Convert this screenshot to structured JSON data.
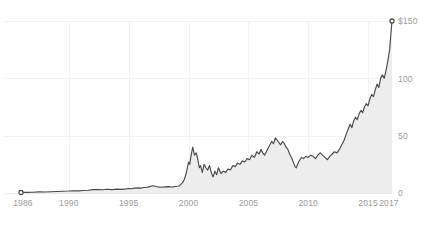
{
  "chart_data": {
    "type": "area",
    "title": "",
    "subtitle": "",
    "xlabel": "",
    "ylabel": "",
    "xlim": [
      1986,
      2017
    ],
    "ylim": [
      0,
      150
    ],
    "grid": true,
    "legend": null,
    "y_ticks": [
      0,
      50,
      100,
      150
    ],
    "y_tick_labels": [
      "0",
      "50",
      "100",
      "$150"
    ],
    "y_axis_position": "right",
    "x_ticks": [
      1986,
      1990,
      1995,
      2000,
      2005,
      2010,
      2015,
      2017
    ],
    "x_tick_labels": [
      "1986",
      "1990",
      "1995",
      "2000",
      "2005",
      "2010",
      "2015",
      "2017"
    ],
    "x_gridlines": [
      1990,
      1995,
      2000,
      2005,
      2010,
      2015
    ],
    "colors": {
      "line": "#4a4a4a",
      "area_fill": "#ededed",
      "gridline": "#f2f2f2",
      "baseline": "#e8e8e8",
      "tick_label": "#9a9a9a",
      "background": "#ffffff",
      "marker_stroke": "#3d3d3d",
      "marker_fill": "#ffffff"
    },
    "markers": [
      {
        "name": "start-marker",
        "x": 1986.0,
        "y": 0.5
      },
      {
        "name": "end-marker",
        "x": 2017.0,
        "y": 150.0
      }
    ],
    "series": [
      {
        "name": "price",
        "x": [
          1986.0,
          1986.5,
          1987.0,
          1987.5,
          1988.0,
          1988.5,
          1989.0,
          1989.5,
          1990.0,
          1990.4,
          1990.8,
          1991.2,
          1991.6,
          1992.0,
          1992.4,
          1992.8,
          1993.2,
          1993.6,
          1994.0,
          1994.4,
          1994.8,
          1995.0,
          1995.2,
          1995.5,
          1995.8,
          1996.0,
          1996.3,
          1996.6,
          1997.0,
          1997.4,
          1997.8,
          1998.0,
          1998.3,
          1998.6,
          1998.8,
          1999.0,
          1999.2,
          1999.35,
          1999.5,
          1999.65,
          1999.8,
          1999.9,
          2000.0,
          2000.1,
          2000.2,
          2000.35,
          2000.5,
          2000.65,
          2000.8,
          2000.9,
          2001.0,
          2001.15,
          2001.3,
          2001.45,
          2001.6,
          2001.75,
          2001.9,
          2002.05,
          2002.2,
          2002.35,
          2002.5,
          2002.7,
          2002.9,
          2003.1,
          2003.3,
          2003.5,
          2003.7,
          2003.9,
          2004.1,
          2004.3,
          2004.5,
          2004.7,
          2004.9,
          2005.1,
          2005.3,
          2005.5,
          2005.7,
          2005.9,
          2006.05,
          2006.2,
          2006.35,
          2006.5,
          2006.65,
          2006.8,
          2006.95,
          2007.1,
          2007.25,
          2007.4,
          2007.55,
          2007.7,
          2007.85,
          2008.0,
          2008.15,
          2008.3,
          2008.45,
          2008.6,
          2008.75,
          2008.9,
          2009.0,
          2009.15,
          2009.3,
          2009.45,
          2009.6,
          2009.8,
          2010.0,
          2010.2,
          2010.4,
          2010.6,
          2010.8,
          2011.0,
          2011.2,
          2011.4,
          2011.6,
          2011.8,
          2012.0,
          2012.2,
          2012.4,
          2012.6,
          2012.8,
          2013.0,
          2013.2,
          2013.35,
          2013.5,
          2013.65,
          2013.8,
          2013.95,
          2014.1,
          2014.25,
          2014.4,
          2014.55,
          2014.7,
          2014.85,
          2015.0,
          2015.15,
          2015.3,
          2015.45,
          2015.6,
          2015.75,
          2015.9,
          2016.05,
          2016.2,
          2016.35,
          2016.5,
          2016.65,
          2016.8,
          2016.9,
          2017.0
        ],
        "y": [
          0.5,
          0.6,
          0.7,
          1.0,
          0.9,
          1.1,
          1.3,
          1.5,
          1.7,
          2.0,
          1.8,
          2.2,
          2.4,
          2.9,
          3.1,
          2.8,
          3.3,
          3.0,
          3.4,
          3.2,
          3.6,
          3.9,
          3.7,
          4.2,
          4.5,
          4.3,
          4.8,
          5.1,
          6.3,
          5.4,
          5.0,
          5.3,
          5.6,
          5.2,
          5.5,
          5.9,
          6.1,
          7.5,
          9.0,
          12.0,
          17.0,
          22.0,
          27.0,
          25.0,
          32.0,
          40.0,
          33.0,
          35.0,
          28.0,
          22.0,
          24.0,
          18.0,
          25.0,
          22.0,
          20.0,
          24.0,
          18.0,
          14.0,
          19.0,
          16.0,
          22.0,
          17.0,
          19.0,
          18.0,
          21.0,
          20.0,
          24.0,
          23.0,
          26.0,
          25.0,
          28.0,
          27.0,
          30.0,
          29.0,
          33.0,
          31.0,
          36.0,
          34.0,
          38.0,
          35.0,
          33.0,
          36.0,
          39.0,
          42.0,
          45.0,
          43.0,
          48.0,
          46.0,
          44.0,
          42.0,
          45.0,
          43.0,
          40.0,
          38.0,
          34.0,
          31.0,
          27.0,
          23.0,
          22.0,
          26.0,
          29.0,
          31.0,
          30.0,
          32.0,
          31.0,
          33.0,
          32.0,
          30.0,
          33.0,
          35.0,
          33.0,
          31.0,
          29.0,
          32.0,
          34.0,
          36.0,
          35.0,
          38.0,
          42.0,
          46.0,
          52.0,
          56.0,
          60.0,
          57.0,
          63.0,
          66.0,
          64.0,
          69.0,
          72.0,
          70.0,
          75.0,
          78.0,
          76.0,
          82.0,
          86.0,
          84.0,
          90.0,
          95.0,
          92.0,
          100.0,
          103.0,
          100.0,
          107.0,
          115.0,
          125.0,
          138.0,
          150.0
        ]
      }
    ]
  }
}
